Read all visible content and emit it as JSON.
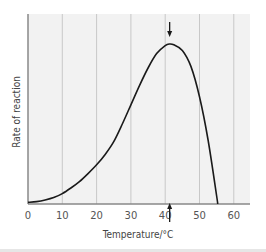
{
  "chart_data": {
    "type": "line",
    "title": "",
    "xlabel": "Temperature/°C",
    "ylabel": "Rate of reaction",
    "xlim": [
      0,
      65
    ],
    "ylim": [
      0,
      1.15
    ],
    "xticks": [
      0,
      10,
      20,
      30,
      40,
      50,
      60
    ],
    "xtick_labels": [
      "0",
      "10",
      "20",
      "30",
      "40",
      "50",
      "60"
    ],
    "yticks": [],
    "grid": "vertical",
    "legend": "none",
    "series": [
      {
        "name": "Rate of reaction",
        "x": [
          0,
          2.5,
          5,
          7.5,
          10,
          12.5,
          15,
          17.5,
          20,
          22.5,
          25,
          27.5,
          30,
          32.5,
          35,
          37.5,
          40,
          41.3,
          42.5,
          45,
          47.5,
          50,
          52.5,
          55,
          55.3
        ],
        "y": [
          0.01,
          0.015,
          0.025,
          0.04,
          0.065,
          0.1,
          0.14,
          0.19,
          0.245,
          0.31,
          0.39,
          0.5,
          0.62,
          0.74,
          0.85,
          0.94,
          0.99,
          1.0,
          0.995,
          0.96,
          0.86,
          0.67,
          0.4,
          0.05,
          0.0
        ]
      }
    ],
    "annotations": [
      {
        "type": "arrow",
        "direction": "down",
        "x": 41.3,
        "position": "above-peak"
      },
      {
        "type": "arrow",
        "direction": "up",
        "x": 41.3,
        "position": "below-axis"
      }
    ],
    "colors": {
      "plot_background": "#f2f2f2",
      "gridline": "#c8c8c8",
      "curve": "#1a1a1a",
      "axis": "#888888"
    }
  }
}
